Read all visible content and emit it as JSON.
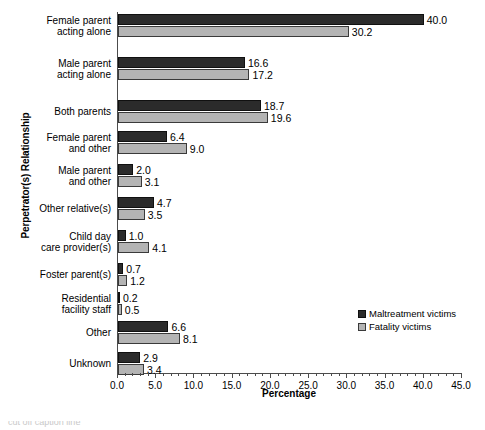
{
  "chart_data": {
    "type": "bar",
    "orientation": "horizontal",
    "title": "",
    "xlabel": "Percentage",
    "ylabel": "Perpetrator(s) Relationship",
    "xlim": [
      0.0,
      45.0
    ],
    "xticks": [
      "0.0",
      "5.0",
      "10.0",
      "15.0",
      "20.0",
      "25.0",
      "30.0",
      "35.0",
      "40.0",
      "45.0"
    ],
    "xtick_values": [
      0,
      5,
      10,
      15,
      20,
      25,
      30,
      35,
      40,
      45
    ],
    "minor_tick_step": 1.0,
    "grid": false,
    "legend_position": "lower-right",
    "categories": [
      "Female parent\nacting alone",
      "Male parent\nacting alone",
      "Both parents",
      "Female parent\nand other",
      "Male parent\nand other",
      "Other relative(s)",
      "Child day\ncare provider(s)",
      "Foster parent(s)",
      "Residential\nfacility staff",
      "Other",
      "Unknown"
    ],
    "series": [
      {
        "name": "Maltreatment victims",
        "color": "#2b2b2b",
        "values": [
          40.0,
          16.6,
          18.7,
          6.4,
          2.0,
          4.7,
          1.0,
          0.7,
          0.2,
          6.6,
          2.9
        ],
        "labels": [
          "40.0",
          "16.6",
          "18.7",
          "6.4",
          "2.0",
          "4.7",
          "1.0",
          "0.7",
          "0.2",
          "6.6",
          "2.9"
        ]
      },
      {
        "name": "Fatality victims",
        "color": "#b4b4b4",
        "values": [
          30.2,
          17.2,
          19.6,
          9.0,
          3.1,
          3.5,
          4.1,
          1.2,
          0.5,
          8.1,
          3.4
        ],
        "labels": [
          "30.2",
          "17.2",
          "19.6",
          "9.0",
          "3.1",
          "3.5",
          "4.1",
          "1.2",
          "0.5",
          "8.1",
          "3.4"
        ]
      }
    ]
  },
  "legend": {
    "entries": [
      {
        "label": "Maltreatment victims",
        "swatch": "dark"
      },
      {
        "label": "Fatality victims",
        "swatch": "light"
      }
    ]
  },
  "caption": {
    "text": "cut off caption line"
  }
}
